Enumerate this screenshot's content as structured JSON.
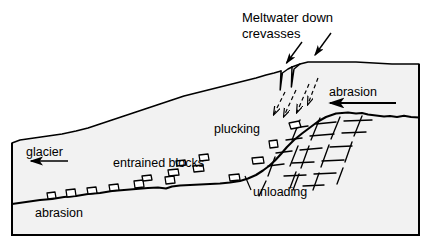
{
  "figure": {
    "background_color": "#ffffff",
    "line_color": "#000000",
    "ice_fill_color": "#f2f2f2",
    "bedrock_fill_color": "#f2f2f2",
    "frame": {
      "x": 11,
      "y": 62,
      "width": 409,
      "height": 174
    }
  },
  "labels": {
    "meltwater_line1": "Meltwater down",
    "meltwater_line2": "crevasses",
    "abrasion_top": "abrasion",
    "plucking": "plucking",
    "glacier": "glacier",
    "entrained_blocks": "entrained blocks",
    "unloading": "unloading",
    "abrasion_bottom": "abrasion"
  },
  "arrows": {
    "glacier_flow_direction": "left",
    "abrasion_top_direction": "left",
    "meltwater_pointer_count": 2,
    "meltwater_flow_arrow_count": 4
  },
  "features": {
    "crevasse_count": 2,
    "entrained_block_count": 11,
    "plucking_block_count": 4,
    "joint_set_description": "orthogonal dashed joints in bedrock"
  }
}
